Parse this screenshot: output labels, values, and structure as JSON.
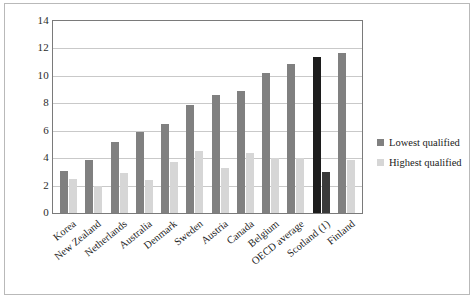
{
  "chart_data": {
    "type": "bar",
    "title": "",
    "subtitle": "",
    "xlabel": "",
    "ylabel": "",
    "ylim": [
      0,
      14
    ],
    "ytick_step": 2,
    "yticks": [
      "14",
      "12",
      "10",
      "8",
      "6",
      "4",
      "2",
      "0"
    ],
    "grid": true,
    "legend_position": "right",
    "highlight_category": "Scotland (1)",
    "categories": [
      "Korea",
      "New Zealand",
      "Netherlands",
      "Australia",
      "Denmark",
      "Sweden",
      "Austria",
      "Canada",
      "Belgium",
      "OECD average",
      "Scotland (1)",
      "Finland"
    ],
    "series": [
      {
        "name": "Lowest qualified",
        "color": "#808080",
        "highlight_color": "#1c1c1c",
        "values": [
          3.1,
          3.9,
          5.2,
          5.9,
          6.5,
          7.9,
          8.6,
          8.9,
          10.2,
          10.9,
          11.4,
          11.7
        ]
      },
      {
        "name": "Highest qualified",
        "color": "#d6d6d6",
        "highlight_color": "#3a3a3a",
        "values": [
          2.5,
          2.0,
          2.9,
          2.4,
          3.7,
          4.5,
          3.3,
          4.4,
          4.0,
          4.0,
          3.0,
          3.9
        ]
      }
    ]
  },
  "legend": {
    "items": [
      {
        "label": "Lowest qualified",
        "marker": "square-swatch-dark"
      },
      {
        "label": "Highest qualified",
        "marker": "square-swatch-light"
      }
    ]
  }
}
